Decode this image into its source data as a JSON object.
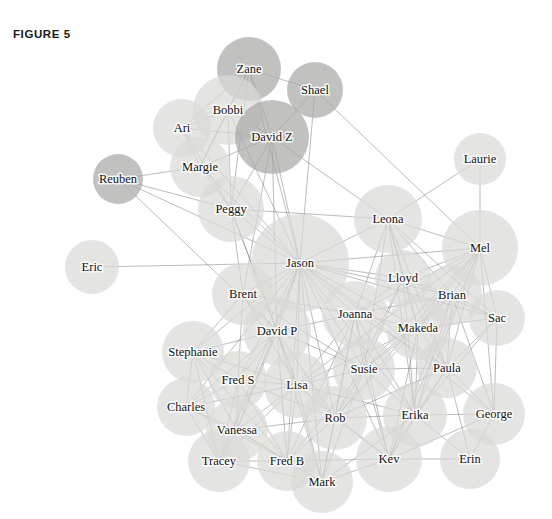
{
  "figure": {
    "label": "FIGURE 5",
    "width": 552,
    "height": 519,
    "background": "#ffffff"
  },
  "style": {
    "node_fill_light": "#d9dad7",
    "node_fill_dark": "#a9aaa7",
    "node_opacity": 0.72,
    "edge_color": "#7e7e7e",
    "label_color": "#111111"
  },
  "chart_data": {
    "type": "network-graph",
    "title": "FIGURE 5",
    "xlabel": "",
    "ylabel": "",
    "legend": [],
    "node_count": 40,
    "nodes": [
      {
        "id": "Zane",
        "label": "Zane",
        "x": 249,
        "y": 69,
        "r": 32,
        "shade": "dark"
      },
      {
        "id": "Shael",
        "label": "Shael",
        "x": 315,
        "y": 90,
        "r": 28,
        "shade": "dark"
      },
      {
        "id": "Bobbi",
        "label": "Bobbi",
        "x": 228,
        "y": 110,
        "r": 35,
        "shade": "light"
      },
      {
        "id": "Ari",
        "label": "Ari",
        "x": 182,
        "y": 128,
        "r": 29,
        "shade": "light"
      },
      {
        "id": "DavidZ",
        "label": "David Z",
        "x": 272,
        "y": 137,
        "r": 37,
        "shade": "dark"
      },
      {
        "id": "Margie",
        "label": "Margie",
        "x": 200,
        "y": 167,
        "r": 30,
        "shade": "light"
      },
      {
        "id": "Reuben",
        "label": "Reuben",
        "x": 118,
        "y": 179,
        "r": 25,
        "shade": "dark"
      },
      {
        "id": "Laurie",
        "label": "Laurie",
        "x": 480,
        "y": 159,
        "r": 26,
        "shade": "light"
      },
      {
        "id": "Peggy",
        "label": "Peggy",
        "x": 231,
        "y": 209,
        "r": 33,
        "shade": "light"
      },
      {
        "id": "Leona",
        "label": "Leona",
        "x": 388,
        "y": 219,
        "r": 34,
        "shade": "light"
      },
      {
        "id": "Mel",
        "label": "Mel",
        "x": 480,
        "y": 248,
        "r": 38,
        "shade": "light"
      },
      {
        "id": "Jason",
        "label": "Jason",
        "x": 300,
        "y": 263,
        "r": 49,
        "shade": "light"
      },
      {
        "id": "Eric",
        "label": "Eric",
        "x": 92,
        "y": 267,
        "r": 27,
        "shade": "light"
      },
      {
        "id": "Lloyd",
        "label": "Lloyd",
        "x": 403,
        "y": 278,
        "r": 28,
        "shade": "light"
      },
      {
        "id": "Brent",
        "label": "Brent",
        "x": 243,
        "y": 294,
        "r": 31,
        "shade": "light"
      },
      {
        "id": "Brian",
        "label": "Brian",
        "x": 452,
        "y": 295,
        "r": 30,
        "shade": "light"
      },
      {
        "id": "Joanna",
        "label": "Joanna",
        "x": 355,
        "y": 314,
        "r": 33,
        "shade": "light"
      },
      {
        "id": "Sac",
        "label": "Sac",
        "x": 497,
        "y": 318,
        "r": 28,
        "shade": "light"
      },
      {
        "id": "Makeda",
        "label": "Makeda",
        "x": 418,
        "y": 328,
        "r": 32,
        "shade": "light"
      },
      {
        "id": "DavidP",
        "label": "David P",
        "x": 277,
        "y": 331,
        "r": 34,
        "shade": "light"
      },
      {
        "id": "Stephanie",
        "label": "Stephanie",
        "x": 193,
        "y": 352,
        "r": 31,
        "shade": "light"
      },
      {
        "id": "Paula",
        "label": "Paula",
        "x": 447,
        "y": 368,
        "r": 30,
        "shade": "light"
      },
      {
        "id": "Susie",
        "label": "Susie",
        "x": 364,
        "y": 369,
        "r": 31,
        "shade": "light"
      },
      {
        "id": "FredS",
        "label": "Fred S",
        "x": 238,
        "y": 380,
        "r": 29,
        "shade": "light"
      },
      {
        "id": "Lisa",
        "label": "Lisa",
        "x": 297,
        "y": 385,
        "r": 33,
        "shade": "light"
      },
      {
        "id": "Charles",
        "label": "Charles",
        "x": 186,
        "y": 407,
        "r": 29,
        "shade": "light"
      },
      {
        "id": "Erika",
        "label": "Erika",
        "x": 415,
        "y": 415,
        "r": 32,
        "shade": "light"
      },
      {
        "id": "George",
        "label": "George",
        "x": 494,
        "y": 414,
        "r": 31,
        "shade": "light"
      },
      {
        "id": "Rob",
        "label": "Rob",
        "x": 335,
        "y": 418,
        "r": 32,
        "shade": "light"
      },
      {
        "id": "Vanessa",
        "label": "Vanessa",
        "x": 237,
        "y": 430,
        "r": 31,
        "shade": "light"
      },
      {
        "id": "Tracey",
        "label": "Tracey",
        "x": 219,
        "y": 461,
        "r": 31,
        "shade": "light"
      },
      {
        "id": "FredB",
        "label": "Fred B",
        "x": 287,
        "y": 461,
        "r": 30,
        "shade": "light"
      },
      {
        "id": "Kev",
        "label": "Kev",
        "x": 389,
        "y": 459,
        "r": 33,
        "shade": "light"
      },
      {
        "id": "Erin",
        "label": "Erin",
        "x": 470,
        "y": 459,
        "r": 30,
        "shade": "light"
      },
      {
        "id": "Mark",
        "label": "Mark",
        "x": 322,
        "y": 482,
        "r": 31,
        "shade": "light"
      }
    ],
    "edges": [
      [
        "Zane",
        "Bobbi"
      ],
      [
        "Zane",
        "DavidZ"
      ],
      [
        "Zane",
        "Ari"
      ],
      [
        "Zane",
        "Margie"
      ],
      [
        "Zane",
        "Peggy"
      ],
      [
        "Zane",
        "Shael"
      ],
      [
        "Zane",
        "Jason"
      ],
      [
        "Shael",
        "DavidZ"
      ],
      [
        "Shael",
        "Jason"
      ],
      [
        "Shael",
        "Mel"
      ],
      [
        "Bobbi",
        "Ari"
      ],
      [
        "Bobbi",
        "DavidZ"
      ],
      [
        "Bobbi",
        "Margie"
      ],
      [
        "Bobbi",
        "Peggy"
      ],
      [
        "Bobbi",
        "Jason"
      ],
      [
        "Ari",
        "Margie"
      ],
      [
        "Ari",
        "DavidZ"
      ],
      [
        "Ari",
        "Peggy"
      ],
      [
        "Ari",
        "Jason"
      ],
      [
        "DavidZ",
        "Margie"
      ],
      [
        "DavidZ",
        "Peggy"
      ],
      [
        "DavidZ",
        "Jason"
      ],
      [
        "DavidZ",
        "Leona"
      ],
      [
        "DavidZ",
        "Brent"
      ],
      [
        "DavidZ",
        "DavidP"
      ],
      [
        "Margie",
        "Peggy"
      ],
      [
        "Margie",
        "Reuben"
      ],
      [
        "Margie",
        "Jason"
      ],
      [
        "Reuben",
        "Peggy"
      ],
      [
        "Reuben",
        "Jason"
      ],
      [
        "Reuben",
        "DavidP"
      ],
      [
        "Peggy",
        "Jason"
      ],
      [
        "Peggy",
        "Brent"
      ],
      [
        "Peggy",
        "Leona"
      ],
      [
        "Peggy",
        "DavidP"
      ],
      [
        "Peggy",
        "Lisa"
      ],
      [
        "Laurie",
        "Mel"
      ],
      [
        "Laurie",
        "Leona"
      ],
      [
        "Leona",
        "Jason"
      ],
      [
        "Leona",
        "Mel"
      ],
      [
        "Leona",
        "Lloyd"
      ],
      [
        "Leona",
        "Brian"
      ],
      [
        "Leona",
        "Joanna"
      ],
      [
        "Leona",
        "Makeda"
      ],
      [
        "Leona",
        "Susie"
      ],
      [
        "Leona",
        "Sac"
      ],
      [
        "Leona",
        "Paula"
      ],
      [
        "Leona",
        "Erika"
      ],
      [
        "Mel",
        "Jason"
      ],
      [
        "Mel",
        "Lloyd"
      ],
      [
        "Mel",
        "Brian"
      ],
      [
        "Mel",
        "Sac"
      ],
      [
        "Mel",
        "Makeda"
      ],
      [
        "Mel",
        "Joanna"
      ],
      [
        "Mel",
        "Susie"
      ],
      [
        "Mel",
        "Paula"
      ],
      [
        "Mel",
        "Erika"
      ],
      [
        "Mel",
        "Kev"
      ],
      [
        "Mel",
        "Rob"
      ],
      [
        "Mel",
        "Lisa"
      ],
      [
        "Mel",
        "George"
      ],
      [
        "Jason",
        "Eric"
      ],
      [
        "Jason",
        "Brent"
      ],
      [
        "Jason",
        "Lloyd"
      ],
      [
        "Jason",
        "Joanna"
      ],
      [
        "Jason",
        "DavidP"
      ],
      [
        "Jason",
        "Stephanie"
      ],
      [
        "Jason",
        "FredS"
      ],
      [
        "Jason",
        "Lisa"
      ],
      [
        "Jason",
        "Susie"
      ],
      [
        "Jason",
        "Makeda"
      ],
      [
        "Jason",
        "Brian"
      ],
      [
        "Jason",
        "Paula"
      ],
      [
        "Jason",
        "Charles"
      ],
      [
        "Jason",
        "Vanessa"
      ],
      [
        "Jason",
        "Tracey"
      ],
      [
        "Jason",
        "FredB"
      ],
      [
        "Jason",
        "Rob"
      ],
      [
        "Jason",
        "Erika"
      ],
      [
        "Jason",
        "Kev"
      ],
      [
        "Jason",
        "Mark"
      ],
      [
        "Jason",
        "Sac"
      ],
      [
        "Jason",
        "George"
      ],
      [
        "Lloyd",
        "Brian"
      ],
      [
        "Lloyd",
        "Joanna"
      ],
      [
        "Lloyd",
        "Makeda"
      ],
      [
        "Lloyd",
        "Susie"
      ],
      [
        "Lloyd",
        "Sac"
      ],
      [
        "Lloyd",
        "Paula"
      ],
      [
        "Lloyd",
        "Erika"
      ],
      [
        "Lloyd",
        "Rob"
      ],
      [
        "Brent",
        "DavidP"
      ],
      [
        "Brent",
        "Stephanie"
      ],
      [
        "Brent",
        "FredS"
      ],
      [
        "Brent",
        "Lisa"
      ],
      [
        "Brent",
        "Joanna"
      ],
      [
        "Brent",
        "Susie"
      ],
      [
        "Brian",
        "Sac"
      ],
      [
        "Brian",
        "Makeda"
      ],
      [
        "Brian",
        "Paula"
      ],
      [
        "Brian",
        "Susie"
      ],
      [
        "Brian",
        "Erika"
      ],
      [
        "Brian",
        "Joanna"
      ],
      [
        "Brian",
        "George"
      ],
      [
        "Brian",
        "Kev"
      ],
      [
        "Joanna",
        "Makeda"
      ],
      [
        "Joanna",
        "Susie"
      ],
      [
        "Joanna",
        "Lisa"
      ],
      [
        "Joanna",
        "DavidP"
      ],
      [
        "Joanna",
        "Rob"
      ],
      [
        "Joanna",
        "Paula"
      ],
      [
        "Joanna",
        "Erika"
      ],
      [
        "Joanna",
        "Kev"
      ],
      [
        "Joanna",
        "Mark"
      ],
      [
        "Joanna",
        "FredB"
      ],
      [
        "Sac",
        "Makeda"
      ],
      [
        "Sac",
        "Paula"
      ],
      [
        "Sac",
        "George"
      ],
      [
        "Sac",
        "Erika"
      ],
      [
        "Makeda",
        "Susie"
      ],
      [
        "Makeda",
        "Paula"
      ],
      [
        "Makeda",
        "Erika"
      ],
      [
        "Makeda",
        "Rob"
      ],
      [
        "Makeda",
        "Kev"
      ],
      [
        "Makeda",
        "Lisa"
      ],
      [
        "DavidP",
        "Stephanie"
      ],
      [
        "DavidP",
        "FredS"
      ],
      [
        "DavidP",
        "Lisa"
      ],
      [
        "DavidP",
        "Charles"
      ],
      [
        "DavidP",
        "Vanessa"
      ],
      [
        "DavidP",
        "Tracey"
      ],
      [
        "DavidP",
        "FredB"
      ],
      [
        "DavidP",
        "Rob"
      ],
      [
        "DavidP",
        "Mark"
      ],
      [
        "DavidP",
        "Susie"
      ],
      [
        "Stephanie",
        "FredS"
      ],
      [
        "Stephanie",
        "Charles"
      ],
      [
        "Stephanie",
        "Vanessa"
      ],
      [
        "Stephanie",
        "Tracey"
      ],
      [
        "Stephanie",
        "Lisa"
      ],
      [
        "Stephanie",
        "FredB"
      ],
      [
        "Paula",
        "Susie"
      ],
      [
        "Paula",
        "Erika"
      ],
      [
        "Paula",
        "George"
      ],
      [
        "Paula",
        "Erin"
      ],
      [
        "Paula",
        "Kev"
      ],
      [
        "Paula",
        "Rob"
      ],
      [
        "Susie",
        "Lisa"
      ],
      [
        "Susie",
        "Rob"
      ],
      [
        "Susie",
        "Erika"
      ],
      [
        "Susie",
        "Kev"
      ],
      [
        "Susie",
        "FredB"
      ],
      [
        "Susie",
        "Mark"
      ],
      [
        "FredS",
        "Lisa"
      ],
      [
        "FredS",
        "Charles"
      ],
      [
        "FredS",
        "Vanessa"
      ],
      [
        "FredS",
        "Tracey"
      ],
      [
        "FredS",
        "FredB"
      ],
      [
        "FredS",
        "Rob"
      ],
      [
        "Lisa",
        "Charles"
      ],
      [
        "Lisa",
        "Vanessa"
      ],
      [
        "Lisa",
        "Tracey"
      ],
      [
        "Lisa",
        "FredB"
      ],
      [
        "Lisa",
        "Rob"
      ],
      [
        "Lisa",
        "Mark"
      ],
      [
        "Lisa",
        "Kev"
      ],
      [
        "Lisa",
        "Erika"
      ],
      [
        "Charles",
        "Vanessa"
      ],
      [
        "Charles",
        "Tracey"
      ],
      [
        "Charles",
        "FredB"
      ],
      [
        "Erika",
        "George"
      ],
      [
        "Erika",
        "Erin"
      ],
      [
        "Erika",
        "Kev"
      ],
      [
        "Erika",
        "Rob"
      ],
      [
        "Erika",
        "Mark"
      ],
      [
        "George",
        "Erin"
      ],
      [
        "George",
        "Kev"
      ],
      [
        "Rob",
        "Kev"
      ],
      [
        "Rob",
        "Mark"
      ],
      [
        "Rob",
        "FredB"
      ],
      [
        "Rob",
        "Vanessa"
      ],
      [
        "Vanessa",
        "Tracey"
      ],
      [
        "Vanessa",
        "FredB"
      ],
      [
        "Vanessa",
        "Mark"
      ],
      [
        "Tracey",
        "FredB"
      ],
      [
        "Tracey",
        "Mark"
      ],
      [
        "FredB",
        "Mark"
      ],
      [
        "FredB",
        "Kev"
      ],
      [
        "Kev",
        "Erin"
      ],
      [
        "Kev",
        "Mark"
      ]
    ]
  }
}
